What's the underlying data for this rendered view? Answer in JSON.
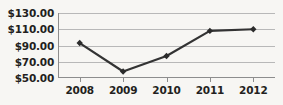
{
  "chart_data": {
    "type": "line",
    "title": "",
    "subtitle": "",
    "xlabel": "",
    "ylabel": "",
    "categories": [
      "2008",
      "2009",
      "2010",
      "2011",
      "2012"
    ],
    "values": [
      93.0,
      58.0,
      77.0,
      108.0,
      110.0
    ],
    "series": [
      {
        "name": "",
        "values": [
          93.0,
          58.0,
          77.0,
          108.0,
          110.0
        ]
      }
    ],
    "ylim": [
      50,
      130
    ],
    "yticks": [
      50,
      70,
      90,
      110,
      130
    ],
    "ytick_labels": [
      "$50.00",
      "$70.00",
      "$90.00",
      "$110.00",
      "$130.00"
    ],
    "xtick_labels": [
      "2008",
      "2009",
      "2010",
      "2011",
      "2012"
    ],
    "grid": true,
    "grid_axis": "y",
    "legend": false,
    "legend_position": "none",
    "marker": "diamond",
    "colors": {
      "line": "#333333",
      "marker": "#2b2b2b",
      "gridline": "#b8b8b8",
      "axis": "#8d8d8d",
      "text": "#231f20",
      "background": "#f7f6f3"
    }
  }
}
